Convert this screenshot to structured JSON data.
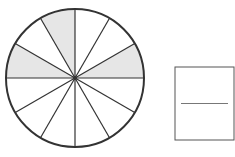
{
  "diagram": {
    "type": "fraction-circle",
    "circle": {
      "cx": 75,
      "cy": 78,
      "r": 69,
      "slices": 12
    },
    "shaded_slices": [
      {
        "start_deg": 90,
        "end_deg": 120
      },
      {
        "start_deg": 150,
        "end_deg": 180
      },
      {
        "start_deg": 0,
        "end_deg": 30
      }
    ],
    "shaded_count": 3,
    "total_count": 12,
    "colors": {
      "stroke": "#333333",
      "shade": "#e6e6e6",
      "box_stroke": "#555555",
      "fraction_line": "#777777"
    },
    "answer_box": {
      "x": 175,
      "y": 67,
      "width": 59,
      "height": 73,
      "numerator": "",
      "denominator": ""
    }
  }
}
